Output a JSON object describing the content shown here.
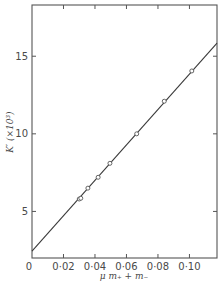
{
  "chart_data": {
    "type": "scatter",
    "title": "",
    "xlabel": "μ m₊ + m₋",
    "ylabel": "K′ (×10³)",
    "xlim": [
      0,
      0.1175
    ],
    "ylim": [
      2.0,
      18.3
    ],
    "x_ticks": [
      0,
      0.02,
      0.04,
      0.06,
      0.08,
      0.1
    ],
    "x_tick_labels": [
      "0",
      "0·02",
      "0·04",
      "0·06",
      "0·08",
      "0·10"
    ],
    "y_ticks": [
      5,
      10,
      15
    ],
    "y_tick_labels": [
      "5",
      "10",
      "15"
    ],
    "grid": false,
    "legend": null,
    "series": [
      {
        "name": "measured",
        "marker": "open-circle",
        "x": [
          0.03,
          0.031,
          0.0355,
          0.042,
          0.0495,
          0.0665,
          0.084,
          0.1015
        ],
        "y": [
          5.8,
          5.85,
          6.5,
          7.2,
          8.1,
          10.0,
          12.1,
          14.05
        ]
      },
      {
        "name": "fit line",
        "style": "line",
        "x": [
          0,
          0.1175
        ],
        "y": [
          2.45,
          15.85
        ]
      }
    ]
  },
  "colors": {
    "axis": "#555555",
    "line": "#3a3a3a",
    "marker": "#555555",
    "text": "#4a4a4a"
  }
}
